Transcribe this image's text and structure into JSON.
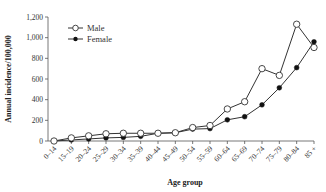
{
  "chart_data": {
    "type": "line",
    "title": "",
    "xlabel": "Age group",
    "ylabel": "Annual incidence/100,000",
    "ylim": [
      0,
      1200
    ],
    "yticks": [
      0,
      200,
      400,
      600,
      800,
      1000,
      1200
    ],
    "ytick_labels": [
      "0",
      "200",
      "400",
      "600",
      "800",
      "1,000",
      "1,200"
    ],
    "grid": false,
    "legend_position": "upper-left",
    "categories": [
      "0–14",
      "15–19",
      "20–24",
      "25–29",
      "30–34",
      "35–39",
      "40–44",
      "45–49",
      "50–54",
      "55–59",
      "60–64",
      "65–69",
      "70–74",
      "75–79",
      "80–84",
      "85 +"
    ],
    "series": [
      {
        "name": "Male",
        "marker": "open-circle",
        "values": [
          0,
          30,
          50,
          70,
          75,
          75,
          75,
          80,
          130,
          150,
          310,
          380,
          700,
          635,
          1130,
          905
        ]
      },
      {
        "name": "Female",
        "marker": "filled-circle",
        "values": [
          0,
          10,
          20,
          30,
          35,
          45,
          75,
          80,
          115,
          120,
          205,
          235,
          350,
          515,
          710,
          960
        ]
      }
    ]
  }
}
